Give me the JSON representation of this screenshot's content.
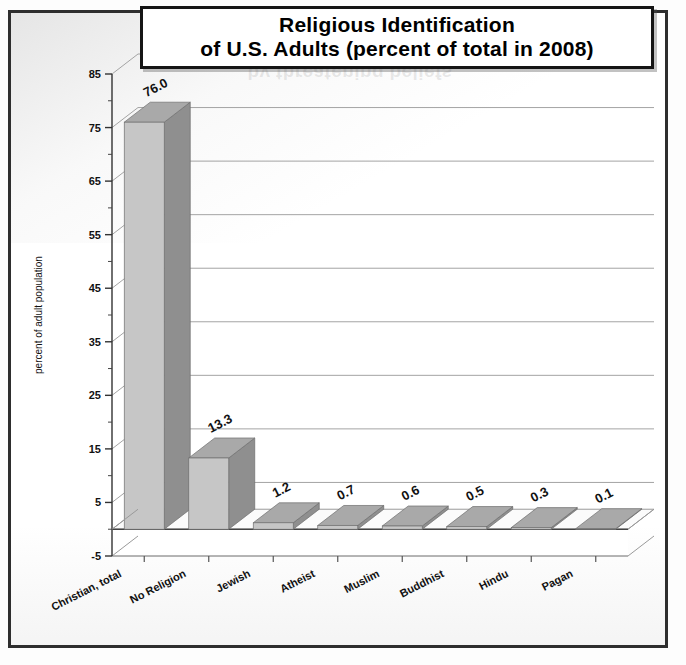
{
  "figure": {
    "title_line1": "Religious Identification",
    "title_line2": "of U.S. Adults (percent of total in 2008)",
    "ghost_text": "by threatening beliefs"
  },
  "colors": {
    "bar_front": "#c6c6c6",
    "bar_side": "#8f8f8f",
    "bar_top": "#a9a9a9",
    "floor": "#f2f2f2",
    "gridline": "#9a9a9a",
    "axis": "#4a4a4a",
    "text": "#111111",
    "frame": "#2e2e2e"
  },
  "chart_data": {
    "type": "bar",
    "title": "Religious Identification of U.S. Adults (percent of total in 2008)",
    "xlabel": "",
    "ylabel": "percent of adult population",
    "categories": [
      "Christian, total",
      "No Religion",
      "Jewish",
      "Atheist",
      "Muslim",
      "Buddhist",
      "Hindu",
      "Pagan"
    ],
    "values": [
      76.0,
      13.3,
      1.2,
      0.7,
      0.6,
      0.5,
      0.3,
      0.1
    ],
    "data_labels": [
      "76.0",
      "13.3",
      "1.2",
      "0.7",
      "0.6",
      "0.5",
      "0.3",
      "0.1"
    ],
    "ylim": [
      -5,
      85
    ],
    "yticks": [
      -5,
      5,
      15,
      25,
      35,
      45,
      55,
      65,
      75,
      85
    ],
    "ytick_labels": [
      "-5",
      "5",
      "15",
      "25",
      "35",
      "45",
      "55",
      "65",
      "75",
      "85"
    ],
    "minor_tick_step": 5,
    "grid": true,
    "legend": false,
    "three_d": true
  }
}
